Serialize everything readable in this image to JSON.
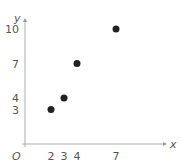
{
  "chart_data": {
    "type": "scatter",
    "title": "",
    "xlabel": "x",
    "ylabel": "y",
    "origin_label": "O",
    "points": [
      {
        "x": 2,
        "y": 3
      },
      {
        "x": 3,
        "y": 4
      },
      {
        "x": 4,
        "y": 7
      },
      {
        "x": 7,
        "y": 10
      }
    ],
    "x_ticks": [
      2,
      3,
      4,
      7
    ],
    "y_ticks": [
      3,
      4,
      7,
      10
    ],
    "xlim": [
      0,
      11
    ],
    "ylim": [
      0,
      11
    ],
    "grid": false,
    "legend": null,
    "colors": {
      "point": "#222222",
      "axis": "#999999",
      "text": "#555555"
    }
  }
}
